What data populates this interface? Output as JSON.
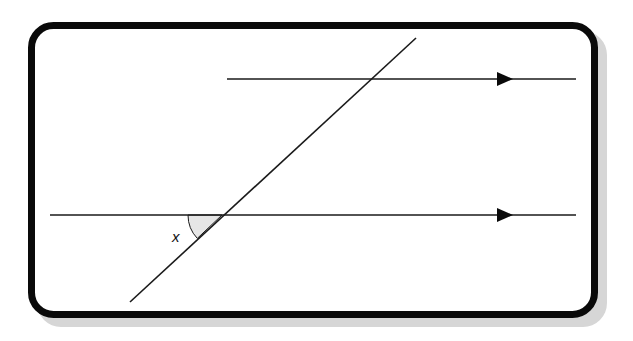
{
  "diagram": {
    "type": "parallel-lines-transversal",
    "frame": {
      "x": 28,
      "y": 22,
      "width": 570,
      "height": 296,
      "radius": 24,
      "border_color": "#0a0a0a",
      "border_width": 7,
      "shadow_color": "#d4d4d4",
      "shadow_offset": 9
    },
    "parallel_lines": [
      {
        "id": "upper",
        "x1": 227,
        "y1": 79,
        "x2": 576,
        "y2": 79,
        "arrow_at_x": 505
      },
      {
        "id": "lower",
        "x1": 50,
        "y1": 215,
        "x2": 576,
        "y2": 215,
        "arrow_at_x": 505
      }
    ],
    "transversal": {
      "x1": 130,
      "y1": 302,
      "x2": 416,
      "y2": 38
    },
    "angle": {
      "label": "x",
      "vertex_x": 222,
      "vertex_y": 215,
      "radius": 34,
      "fill": "#e6e6e6",
      "label_x": 172,
      "label_y": 242
    },
    "line_color": "#1a1a1a"
  }
}
